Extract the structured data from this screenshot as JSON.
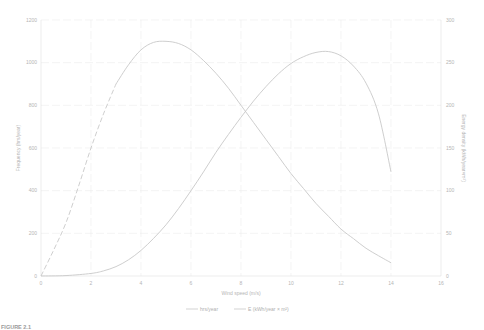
{
  "chart_data": {
    "type": "line",
    "title": "",
    "xlabel": "Wind speed (m/s)",
    "ylabel": "Frequency (hrs/year)",
    "y2label": "Energy density (kWh/year×m²)",
    "xlim": [
      0,
      16
    ],
    "ylim": [
      0,
      1200
    ],
    "y2lim": [
      0,
      300
    ],
    "x_ticks": [
      0,
      2,
      4,
      6,
      8,
      10,
      12,
      14,
      16
    ],
    "y_ticks": [
      0,
      200,
      400,
      600,
      800,
      1000,
      1200
    ],
    "y2_ticks": [
      0,
      50,
      100,
      150,
      200,
      250,
      300
    ],
    "grid": true,
    "legend_position": "bottom",
    "series": [
      {
        "name": "hrs/year",
        "axis": "left",
        "color": "#c8c8c8",
        "dashed_until_x": 3,
        "x": [
          0,
          0.5,
          1,
          1.5,
          2,
          2.5,
          3,
          3.5,
          4,
          4.5,
          5,
          5.5,
          6,
          6.5,
          7,
          7.5,
          8,
          8.5,
          9,
          9.5,
          10,
          10.5,
          11,
          11.5,
          12,
          12.5,
          13,
          13.5,
          14
        ],
        "values": [
          0,
          120,
          250,
          420,
          600,
          760,
          900,
          990,
          1060,
          1095,
          1100,
          1090,
          1060,
          1010,
          950,
          880,
          800,
          720,
          640,
          560,
          480,
          410,
          340,
          280,
          220,
          175,
          130,
          95,
          62
        ]
      },
      {
        "name": "E (kWh/year × m²)",
        "axis": "right",
        "color": "#c8c8c8",
        "x": [
          0,
          1,
          2,
          2.5,
          3,
          3.5,
          4,
          4.5,
          5,
          5.5,
          6,
          6.5,
          7,
          7.5,
          8,
          8.5,
          9,
          9.5,
          10,
          10.5,
          11,
          11.5,
          12,
          12.5,
          13,
          13.5,
          14
        ],
        "values": [
          0,
          0.5,
          3,
          6,
          11,
          19,
          30,
          44,
          60,
          79,
          100,
          122,
          145,
          166,
          186,
          205,
          222,
          237,
          249,
          257,
          262,
          263,
          258,
          246,
          226,
          190,
          122
        ]
      }
    ],
    "annotations": []
  },
  "legend": {
    "items": [
      "hrs/year",
      "E (kWh/year × m²)"
    ]
  },
  "caption": "FIGURE 2.1"
}
